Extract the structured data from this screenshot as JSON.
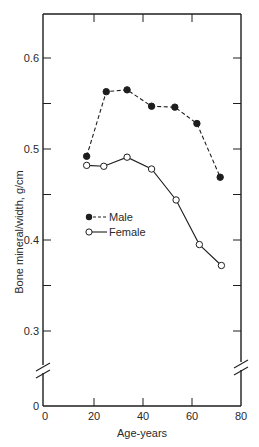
{
  "chart_data": {
    "type": "line",
    "title": "",
    "xlabel": "Age-years",
    "ylabel": "Bone mineral/width, g/cm",
    "xlim": [
      0,
      80
    ],
    "ylim": [
      0,
      0.65
    ],
    "y_axis_break": [
      0.0,
      0.27
    ],
    "x_ticks": [
      0,
      20,
      40,
      60,
      80
    ],
    "x_tick_labels": [
      "0",
      "20",
      "40",
      "60",
      "80"
    ],
    "y_ticks": [
      0,
      0.3,
      0.4,
      0.5,
      0.6
    ],
    "y_tick_labels": [
      "0",
      "0.3",
      "0.4",
      "0.5",
      "0.6"
    ],
    "y_minor_ticks": [
      0.35,
      0.45,
      0.55
    ],
    "grid": false,
    "legend_position": "inside-left-middle",
    "series": [
      {
        "name": "Male",
        "marker": "filled-circle",
        "line_style": "dashed",
        "x": [
          17,
          25,
          33.5,
          43.5,
          53,
          62,
          71.5
        ],
        "values": [
          0.492,
          0.563,
          0.565,
          0.547,
          0.546,
          0.528,
          0.469
        ]
      },
      {
        "name": "Female",
        "marker": "open-circle",
        "line_style": "solid",
        "x": [
          17,
          24,
          33.5,
          43.5,
          53.5,
          63,
          72
        ],
        "values": [
          0.482,
          0.481,
          0.491,
          0.478,
          0.444,
          0.395,
          0.372
        ]
      }
    ]
  },
  "colors": {
    "ink": "#1e1e1e",
    "background": "#ffffff"
  }
}
